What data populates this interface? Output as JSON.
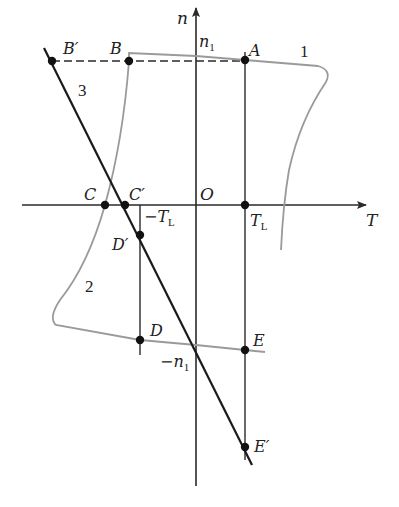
{
  "figure": {
    "axes": {
      "x_label": "T",
      "y_label": "n",
      "origin_label": "O"
    },
    "tick_labels": {
      "n1": "n",
      "n1_sub": "1",
      "neg_n1": "−n",
      "neg_n1_sub": "1",
      "TL": "T",
      "TL_sub": "L",
      "neg_TL": "−T",
      "neg_TL_sub": "L"
    },
    "points": {
      "A": "A",
      "B": "B",
      "B_prime": "B′",
      "C": "C",
      "C_prime": "C′",
      "D": "D",
      "D_prime": "D′",
      "E": "E",
      "E_prime": "E′"
    },
    "curve_labels": {
      "curve1": "1",
      "curve2": "2",
      "line3": "3"
    },
    "colors": {
      "axis": "#2a2a2a",
      "line3": "#1a1a1a",
      "curves": "#9a9a9a",
      "points": "#111111"
    }
  }
}
